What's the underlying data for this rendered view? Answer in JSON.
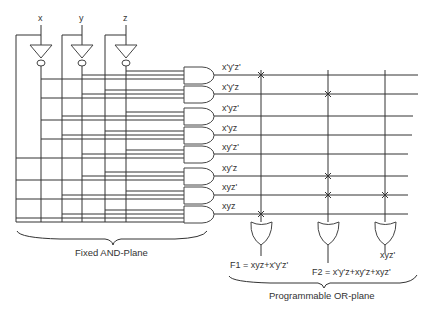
{
  "diagram": {
    "inputs": [
      "x",
      "y",
      "z"
    ],
    "product_terms": [
      "x'y'z'",
      "x'y'z",
      "x'yz'",
      "x'yz",
      "xy'z'",
      "xy'z",
      "xyz'",
      "xyz"
    ],
    "outputs": [
      {
        "label": "F1 = xyz+x'y'z'",
        "connections": [
          0,
          7
        ]
      },
      {
        "label": "F2 = x'y'z+xy'z+xyz'",
        "connections": [
          1,
          5,
          6
        ]
      },
      {
        "label": "xyz'",
        "connections": [
          6
        ]
      }
    ],
    "captions": {
      "and_plane": "Fixed AND-Plane",
      "or_plane": "Programmable OR-plane"
    }
  }
}
